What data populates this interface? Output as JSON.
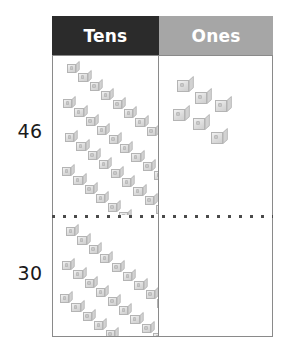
{
  "worksheet": {
    "type": "place-value-chart",
    "columns": [
      {
        "id": "tens",
        "label": "Tens",
        "header_bg": "#2b2b2b",
        "header_text_color": "#ffffff"
      },
      {
        "id": "ones",
        "label": "Ones",
        "header_bg": "#a6a6a6",
        "header_text_color": "#ffffff"
      }
    ],
    "rows": [
      {
        "id": "row-46",
        "number_label": "46",
        "tens_count": 4,
        "ones_count": 6,
        "tens_rods": [
          {
            "x": 14,
            "y": 5
          },
          {
            "x": 10,
            "y": 40
          },
          {
            "x": 12,
            "y": 74
          },
          {
            "x": 9,
            "y": 108
          }
        ],
        "ones_cubes": [
          {
            "x": 18,
            "y": 20
          },
          {
            "x": 36,
            "y": 32
          },
          {
            "x": 56,
            "y": 40
          },
          {
            "x": 14,
            "y": 49
          },
          {
            "x": 34,
            "y": 58
          },
          {
            "x": 52,
            "y": 72
          }
        ]
      },
      {
        "id": "row-30",
        "number_label": "30",
        "tens_count": 3,
        "ones_count": 0,
        "tens_rods": [
          {
            "x": 13,
            "y": 6
          },
          {
            "x": 9,
            "y": 40
          },
          {
            "x": 7,
            "y": 73
          }
        ],
        "ones_cubes": []
      }
    ],
    "rod_cube_count": 10,
    "rod_cube_step": {
      "dx": 11.4,
      "dy": 9.0
    },
    "colors": {
      "table_border": "#8a8a8a",
      "row_divider": "#4a4a4a",
      "cube_light": "#f2f2f2",
      "cube_mid": "#dcdcdc",
      "cube_dark": "#cfcfcf",
      "label_text": "#1a1a1a",
      "page_background": "#ffffff"
    }
  }
}
